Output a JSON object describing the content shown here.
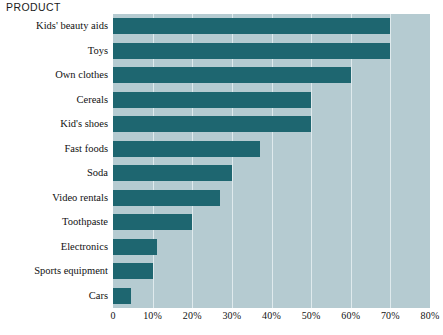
{
  "chart_data": {
    "type": "bar",
    "orientation": "horizontal",
    "title": "",
    "ylabel": "PRODUCT",
    "xlabel": "",
    "categories": [
      "Kids' beauty aids",
      "Toys",
      "Own clothes",
      "Cereals",
      "Kid's shoes",
      "Fast foods",
      "Soda",
      "Video rentals",
      "Toothpaste",
      "Electronics",
      "Sports equipment",
      "Cars"
    ],
    "values": [
      70,
      70,
      60,
      50,
      50,
      37,
      30,
      27,
      20,
      11,
      10,
      4.5
    ],
    "xlim": [
      0,
      80
    ],
    "xticks": [
      0,
      10,
      20,
      30,
      40,
      50,
      60,
      70,
      80
    ],
    "xtick_labels": [
      "0",
      "10%",
      "20%",
      "30%",
      "40%",
      "50%",
      "60%",
      "70%",
      "80%"
    ],
    "grid": true,
    "grid_axis": "x",
    "legend": "none",
    "colors": {
      "bar": "#1e6670",
      "plot_background": "#b5cbd1",
      "gridline": "#dfeaed",
      "page_background": "#ffffff",
      "text": "#111111"
    }
  }
}
